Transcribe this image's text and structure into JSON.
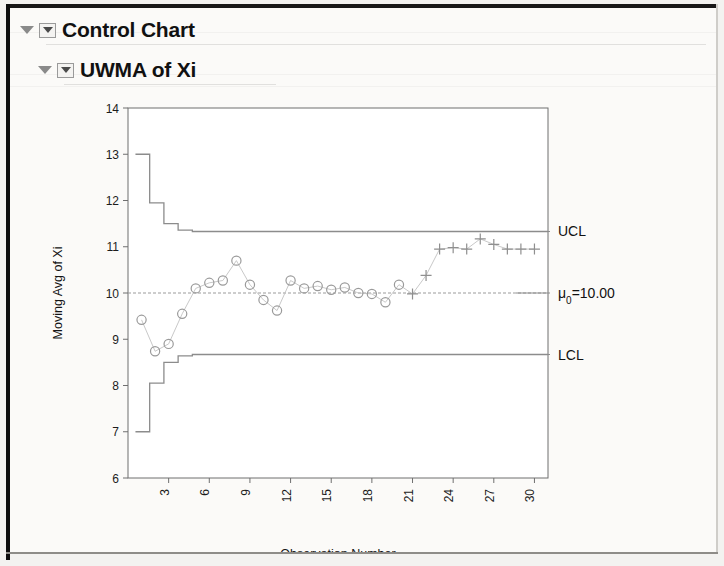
{
  "window": {
    "outline": [
      {
        "label": "Control Chart",
        "level": 0,
        "expanded": true
      },
      {
        "label": "UWMA of Xi",
        "level": 1,
        "expanded": true
      }
    ]
  },
  "chart_data": {
    "type": "line",
    "title": "UWMA of Xi",
    "xlabel": "Observation Number",
    "ylabel": "Moving Avg of Xi",
    "xlim": [
      0,
      31
    ],
    "ylim": [
      6,
      14
    ],
    "yticks": [
      6,
      7,
      8,
      9,
      10,
      11,
      12,
      13,
      14
    ],
    "xticks": [
      3,
      6,
      9,
      12,
      15,
      18,
      21,
      24,
      27,
      30
    ],
    "grid": false,
    "legend": "none",
    "center_line": {
      "label": "μ₀=10.00",
      "value": 10.0
    },
    "limits": {
      "ucl_label": "UCL",
      "lcl_label": "LCL",
      "ucl_steady": 11.33,
      "lcl_steady": 8.67,
      "ucl_steps": [
        13.0,
        11.95,
        11.5,
        11.36,
        11.33
      ],
      "lcl_steps": [
        7.0,
        8.05,
        8.5,
        8.64,
        8.67
      ]
    },
    "x": [
      1,
      2,
      3,
      4,
      5,
      6,
      7,
      8,
      9,
      10,
      11,
      12,
      13,
      14,
      15,
      16,
      17,
      18,
      19,
      20,
      21,
      22,
      23,
      24,
      25,
      26,
      27,
      28,
      29,
      30
    ],
    "series": [
      {
        "name": "Moving Avg of Xi",
        "values": [
          9.42,
          8.74,
          8.9,
          9.55,
          10.1,
          10.22,
          10.27,
          10.7,
          10.18,
          9.85,
          9.62,
          10.27,
          10.1,
          10.15,
          10.07,
          10.12,
          10.0,
          9.98,
          9.8,
          10.18,
          9.98,
          10.38,
          10.95,
          10.98,
          10.95,
          11.17,
          11.05,
          10.95,
          10.95,
          10.95
        ],
        "markers": [
          "circle",
          "circle",
          "circle",
          "circle",
          "circle",
          "circle",
          "circle",
          "circle",
          "circle",
          "circle",
          "circle",
          "circle",
          "circle",
          "circle",
          "circle",
          "circle",
          "circle",
          "circle",
          "circle",
          "circle",
          "plus",
          "plus",
          "plus",
          "plus",
          "plus",
          "plus",
          "plus",
          "plus",
          "plus",
          "plus"
        ]
      }
    ]
  },
  "colors": {
    "page_background": "#fbfaf8",
    "limit_line": "#8c8c8c",
    "center_line": "#9b9b9b",
    "marker": "#9a9a9a",
    "text": "#111111"
  }
}
